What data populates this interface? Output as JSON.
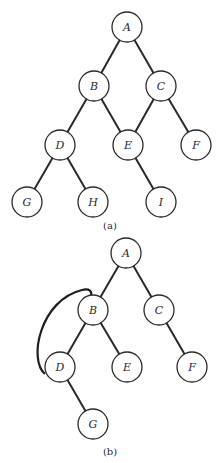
{
  "figure_a": {
    "caption": "(a)",
    "nodes": [
      {
        "id": "A",
        "label": "A",
        "x": 127,
        "y": 27
      },
      {
        "id": "B",
        "label": "B",
        "x": 94,
        "y": 86
      },
      {
        "id": "C",
        "label": "C",
        "x": 161,
        "y": 86
      },
      {
        "id": "D",
        "label": "D",
        "x": 60,
        "y": 145
      },
      {
        "id": "E",
        "label": "E",
        "x": 128,
        "y": 145
      },
      {
        "id": "F",
        "label": "F",
        "x": 196,
        "y": 145
      },
      {
        "id": "G",
        "label": "G",
        "x": 27,
        "y": 202
      },
      {
        "id": "H",
        "label": "H",
        "x": 93,
        "y": 202
      },
      {
        "id": "I",
        "label": "I",
        "x": 161,
        "y": 202
      }
    ],
    "edges": [
      [
        "A",
        "B"
      ],
      [
        "A",
        "C"
      ],
      [
        "B",
        "D"
      ],
      [
        "B",
        "E"
      ],
      [
        "C",
        "E"
      ],
      [
        "C",
        "F"
      ],
      [
        "D",
        "G"
      ],
      [
        "D",
        "H"
      ],
      [
        "E",
        "I"
      ]
    ]
  },
  "figure_b": {
    "caption": "(b)",
    "nodes": [
      {
        "id": "A",
        "label": "A",
        "x": 126,
        "y": 253
      },
      {
        "id": "B",
        "label": "B",
        "x": 93,
        "y": 310
      },
      {
        "id": "C",
        "label": "C",
        "x": 159,
        "y": 310
      },
      {
        "id": "D",
        "label": "D",
        "x": 60,
        "y": 367
      },
      {
        "id": "E",
        "label": "E",
        "x": 127,
        "y": 367
      },
      {
        "id": "F",
        "label": "F",
        "x": 192,
        "y": 367
      },
      {
        "id": "G",
        "label": "G",
        "x": 93,
        "y": 424
      }
    ],
    "edges": [
      [
        "A",
        "B"
      ],
      [
        "A",
        "C"
      ],
      [
        "B",
        "D"
      ],
      [
        "B",
        "E"
      ],
      [
        "C",
        "F"
      ],
      [
        "D",
        "G"
      ]
    ],
    "back_edge": {
      "from": "D",
      "to": "B",
      "style": "curved"
    }
  },
  "style": {
    "node_radius": 15,
    "stroke_color": "#2a2a2a",
    "background": "#ffffff"
  }
}
